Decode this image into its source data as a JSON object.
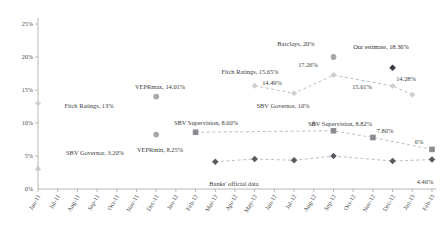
{
  "chart_data": {
    "type": "scatter",
    "title": "",
    "xlabel": "",
    "ylabel": "",
    "ylim": [
      0,
      25
    ],
    "ytick_labels": [
      "0%",
      "5%",
      "10%",
      "15%",
      "20%",
      "25%"
    ],
    "ytick_values": [
      0,
      5,
      10,
      15,
      20,
      25
    ],
    "grid": false,
    "legend_position": "none",
    "x": [
      "Jun-11",
      "Jul-11",
      "Aug-11",
      "Sep-11",
      "Oct-11",
      "Nov-11",
      "Dec-11",
      "Jan-12",
      "Feb-12",
      "Mar-12",
      "Apr-12",
      "May-12",
      "Jun-12",
      "Jul-12",
      "Aug-12",
      "Sep-12",
      "Oct-12",
      "Nov-12",
      "Dec-12",
      "Jan-13",
      "Feb-13"
    ],
    "series": [
      {
        "name": "Banks' official data",
        "marker": "diamond-dark",
        "line": "dashed",
        "points": [
          {
            "x": "Mar-12",
            "y": 4.14
          },
          {
            "x": "May-12",
            "y": 4.55
          },
          {
            "x": "Jul-12",
            "y": 4.35
          },
          {
            "x": "Sep-12",
            "y": 5.0
          },
          {
            "x": "Dec-12",
            "y": 4.24
          },
          {
            "x": "Feb-13",
            "y": 4.46
          }
        ],
        "labels": [
          {
            "x": "Feb-13",
            "y": 4.46,
            "text": "4.46%"
          }
        ]
      },
      {
        "name": "SBV Supervision",
        "marker": "square-grey",
        "line": "dashed",
        "points": [
          {
            "x": "Feb-12",
            "y": 8.6
          },
          {
            "x": "Sep-12",
            "y": 8.82
          },
          {
            "x": "Nov-12",
            "y": 7.8
          },
          {
            "x": "Feb-13",
            "y": 6.0
          }
        ],
        "labels": [
          {
            "x": "Feb-12",
            "y": 8.6,
            "text": "SBV Supervision, 8.60%"
          },
          {
            "x": "Sep-12",
            "y": 8.82,
            "text": "SBV Supervision, 8.82%"
          },
          {
            "x": "Nov-12",
            "y": 7.8,
            "text": "7.80%"
          },
          {
            "x": "Feb-13",
            "y": 6.0,
            "text": "6%"
          }
        ]
      },
      {
        "name": "Analyst estimates track",
        "marker": "diamond-light",
        "line": "dashed",
        "points": [
          {
            "x": "May-12",
            "y": 15.65
          },
          {
            "x": "Jul-12",
            "y": 14.49
          },
          {
            "x": "Sep-12",
            "y": 17.26
          },
          {
            "x": "Dec-12",
            "y": 15.61
          },
          {
            "x": "Jan-13",
            "y": 14.28
          }
        ],
        "labels": [
          {
            "x": "May-12",
            "y": 15.65,
            "text": "Fitch Ratings, 15.65%"
          },
          {
            "x": "Jul-12",
            "y": 14.49,
            "text": "14.49%"
          },
          {
            "x": "Sep-12",
            "y": 17.26,
            "text": "17.26%"
          },
          {
            "x": "Dec-12",
            "y": 15.61,
            "text": "15.61%"
          },
          {
            "x": "Jan-13",
            "y": 14.28,
            "text": "14.28%"
          }
        ]
      }
    ],
    "standalone_markers": [
      {
        "name": "Fitch Ratings",
        "x": "Jun-11",
        "y": 13.0,
        "marker": "diamond-light",
        "label": "Fitch Ratings, 13%"
      },
      {
        "name": "SBV Governor low",
        "x": "Jun-11",
        "y": 3.2,
        "marker": "triangle-light",
        "label": "SBV Governor, 3.20%"
      },
      {
        "name": "VEPRmax",
        "x": "Dec-11",
        "y": 14.01,
        "marker": "circle-grey",
        "label": "VEPRmax, 14.01%"
      },
      {
        "name": "VEPRmin",
        "x": "Dec-11",
        "y": 8.25,
        "marker": "circle-grey",
        "label": "VEPRmin, 8.25%"
      },
      {
        "name": "SBV Governor high",
        "x": "Aug-12",
        "y": 10.0,
        "marker": "triangle-light",
        "label": "SBV Governor, 10%"
      },
      {
        "name": "Barclays",
        "x": "Sep-12",
        "y": 20.0,
        "marker": "circle-grey",
        "label": "Barclays, 20%"
      },
      {
        "name": "Our estimate",
        "x": "Dec-12",
        "y": 18.36,
        "marker": "diamond-darkest",
        "label": "Our estimate, 18.36%"
      }
    ],
    "colors": {
      "axis": "#b0b0b0",
      "text": "#3c3c3c",
      "dark_diamond": "#5a5a62",
      "darkest_diamond": "#3a3a44",
      "grey_square": "#8c8c92",
      "light_diamond": "#cfcfcf",
      "grey_circle": "#a8a8ac",
      "light_triangle": "#c8c8c8",
      "dash_line": "#b5b5b5"
    }
  }
}
